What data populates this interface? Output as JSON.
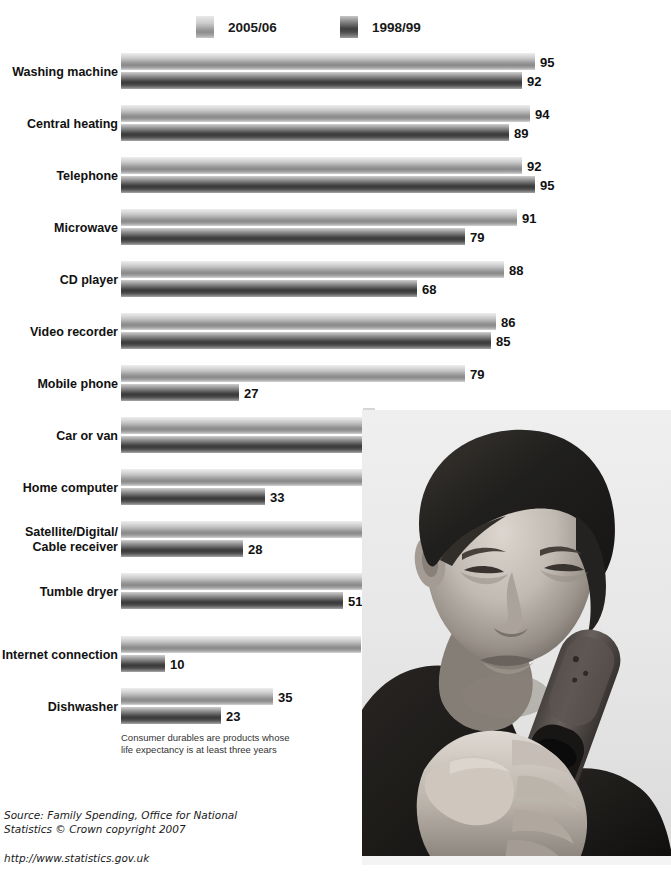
{
  "legend": {
    "items": [
      {
        "label": "2005/06",
        "swatch": "light-gray-gradient-swatch",
        "color": "#a4a4a4"
      },
      {
        "label": "1998/99",
        "swatch": "dark-gray-gradient-swatch",
        "color": "#4f4f4f"
      }
    ]
  },
  "footnote": "Consumer durables are products whose\nlife expectancy is at least three years",
  "source": {
    "text": "Source: Family Spending, Office for National\nStatistics © Crown copyright 2007",
    "url": "http://www.statistics.gov.uk"
  },
  "photo": {
    "alt": "young-man-looking-at-mobile-phone",
    "description": "Black and white photograph of a young man with dark hair holding a mobile phone up and looking at its screen"
  },
  "chart_data": {
    "type": "bar",
    "orientation": "horizontal",
    "title": "",
    "subtitle": "",
    "xlabel": "",
    "ylabel": "",
    "xlim": [
      0,
      100
    ],
    "grid": false,
    "legend_position": "top",
    "value_unit": "percent",
    "categories": [
      "Washing machine",
      "Central heating",
      "Telephone",
      "Microwave",
      "CD player",
      "Video recorder",
      "Mobile phone",
      "Car or van",
      "Home computer",
      "Satellite/Digital/\nCable receiver",
      "Tumble dryer",
      "Internet connection",
      "Dishwasher"
    ],
    "series": [
      {
        "name": "2005/06",
        "color": "#a4a4a4",
        "values": [
          95,
          94,
          92,
          91,
          88,
          86,
          79,
          74,
          65,
          65,
          58,
          55,
          35
        ]
      },
      {
        "name": "1998/99",
        "color": "#4f4f4f",
        "values": [
          92,
          89,
          95,
          79,
          68,
          85,
          27,
          72,
          33,
          28,
          51,
          10,
          23
        ]
      }
    ],
    "annotations": [
      "Consumer durables are products whose life expectancy is at least three years"
    ]
  }
}
